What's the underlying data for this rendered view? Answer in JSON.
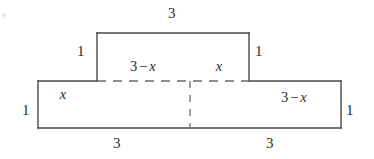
{
  "figure": {
    "kind": "geometry-diagram",
    "stroke_color": "#4a4a4a",
    "dash_color": "#6b6b6b",
    "background_color": "#ffffff",
    "corner_fragment": "e",
    "labels": {
      "top_width": "3",
      "upper_left_height": "1",
      "upper_right_height": "1",
      "upper_inner_left_3_minus_x": {
        "number": "3",
        "operator": "−",
        "variable": "x"
      },
      "upper_inner_right_x": "x",
      "lower_inner_left_x": "x",
      "lower_inner_right_3_minus_x": {
        "number": "3",
        "operator": "−",
        "variable": "x"
      },
      "lower_left_height": "1",
      "lower_right_height": "1",
      "bottom_left_width": "3",
      "bottom_right_width": "3"
    },
    "geometry": {
      "upper_rect": {
        "x1": 97,
        "y1": 33,
        "x2": 249,
        "y2": 81
      },
      "lower_rect": {
        "x1": 38,
        "y1": 81,
        "x2": 341,
        "y2": 128
      },
      "dashed_horizontal": {
        "x1": 97,
        "y1": 81,
        "x2": 249,
        "y2": 81
      },
      "dashed_vertical": {
        "x1": 190,
        "y1": 81,
        "x2": 190,
        "y2": 128
      }
    }
  }
}
